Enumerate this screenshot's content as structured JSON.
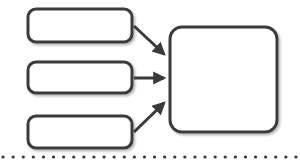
{
  "canvas": {
    "width": 300,
    "height": 168,
    "background_color": "#ffffff",
    "stroke_color": "#3a3a3a",
    "fill_color": "#ffffff",
    "shadow_color": "#bdbdbd"
  },
  "diagram": {
    "type": "flowchart",
    "nodes": [
      {
        "id": "input-box-top",
        "name": "input-box-top",
        "label": "",
        "shape": "rounded-rectangle",
        "x": 28,
        "y": 9,
        "width": 104,
        "height": 33,
        "corner_radius": 8,
        "stroke_width": 3
      },
      {
        "id": "input-box-middle",
        "name": "input-box-middle",
        "label": "",
        "shape": "rounded-rectangle",
        "x": 28,
        "y": 62,
        "width": 104,
        "height": 31,
        "corner_radius": 8,
        "stroke_width": 3
      },
      {
        "id": "input-box-bottom",
        "name": "input-box-bottom",
        "label": "",
        "shape": "rounded-rectangle",
        "x": 28,
        "y": 116,
        "width": 104,
        "height": 32,
        "corner_radius": 8,
        "stroke_width": 3
      },
      {
        "id": "output-box",
        "name": "output-box",
        "label": "",
        "shape": "rounded-square",
        "x": 170,
        "y": 27,
        "width": 107,
        "height": 105,
        "corner_radius": 12,
        "stroke_width": 3
      }
    ],
    "connectors": [
      {
        "id": "arrow-top",
        "name": "arrow-top-to-output",
        "from": "input-box-top",
        "to": "output-box",
        "direction": "diagonal-down-right",
        "start": {
          "x": 134,
          "y": 26
        },
        "end": {
          "x": 168,
          "y": 58
        },
        "stroke_width": 3,
        "arrowhead": "filled-triangle"
      },
      {
        "id": "arrow-middle",
        "name": "arrow-middle-to-output",
        "from": "input-box-middle",
        "to": "output-box",
        "direction": "horizontal-right",
        "start": {
          "x": 134,
          "y": 78
        },
        "end": {
          "x": 168,
          "y": 78
        },
        "stroke_width": 3,
        "arrowhead": "filled-triangle"
      },
      {
        "id": "arrow-bottom",
        "name": "arrow-bottom-to-output",
        "from": "input-box-bottom",
        "to": "output-box",
        "direction": "diagonal-up-right",
        "start": {
          "x": 134,
          "y": 132
        },
        "end": {
          "x": 168,
          "y": 99
        },
        "stroke_width": 3,
        "arrowhead": "filled-triangle"
      }
    ],
    "dotted_rule": {
      "name": "dotted-divider",
      "y": 157,
      "x_start": 2,
      "x_end": 298,
      "dot_radius": 1.6,
      "dot_spacing": 10,
      "color": "#3a3a3a"
    },
    "ghost_watermark": {
      "visible": true,
      "legible": false,
      "color": "#d9d2cb",
      "note": "Faint unreadable background scan artifact behind the shapes",
      "fragments": [
        {
          "text": "",
          "x": 34,
          "y": 12,
          "size": 22
        },
        {
          "text": "",
          "x": 30,
          "y": 40,
          "size": 20
        },
        {
          "text": "",
          "x": 36,
          "y": 118,
          "size": 20
        }
      ]
    }
  }
}
